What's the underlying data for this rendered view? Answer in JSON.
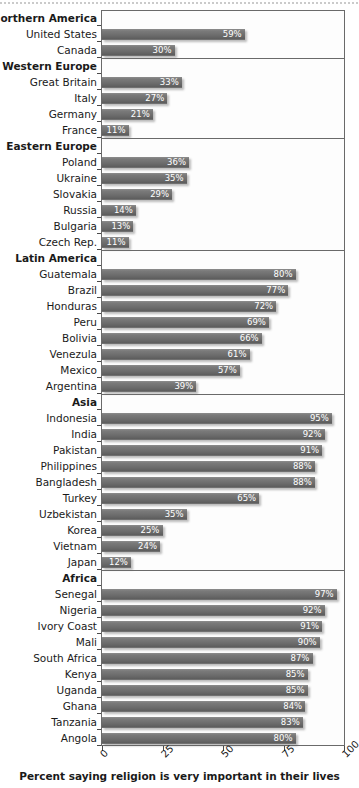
{
  "chart_data": {
    "type": "bar",
    "title": "",
    "subtitle": "",
    "xlabel": "Percent saying religion is very important in their lives",
    "ylabel": "",
    "xlim": [
      0,
      100
    ],
    "xticks": [
      0,
      25,
      50,
      75,
      100
    ],
    "xtick_labels": [
      "0",
      "25",
      "50",
      "75",
      "100"
    ],
    "grid": false,
    "legend": "none",
    "orientation": "horizontal",
    "value_suffix": "%",
    "bar_color": "#6d6d6d",
    "value_label_color": "#ffffff",
    "frame_color": "#6a6a6a",
    "groups": [
      {
        "name": "Northern  America",
        "items": [
          {
            "label": "United States",
            "value": 59,
            "value_label": "59%"
          },
          {
            "label": "Canada",
            "value": 30,
            "value_label": "30%"
          }
        ]
      },
      {
        "name": "Western Europe",
        "items": [
          {
            "label": "Great Britain",
            "value": 33,
            "value_label": "33%"
          },
          {
            "label": "Italy",
            "value": 27,
            "value_label": "27%"
          },
          {
            "label": "Germany",
            "value": 21,
            "value_label": "21%"
          },
          {
            "label": "France",
            "value": 11,
            "value_label": "11%"
          }
        ]
      },
      {
        "name": "Eastern Europe",
        "items": [
          {
            "label": "Poland",
            "value": 36,
            "value_label": "36%"
          },
          {
            "label": "Ukraine",
            "value": 35,
            "value_label": "35%"
          },
          {
            "label": "Slovakia",
            "value": 29,
            "value_label": "29%"
          },
          {
            "label": "Russia",
            "value": 14,
            "value_label": "14%"
          },
          {
            "label": "Bulgaria",
            "value": 13,
            "value_label": "13%"
          },
          {
            "label": "Czech Rep.",
            "value": 11,
            "value_label": "11%"
          }
        ]
      },
      {
        "name": "Latin America",
        "items": [
          {
            "label": "Guatemala",
            "value": 80,
            "value_label": "80%"
          },
          {
            "label": "Brazil",
            "value": 77,
            "value_label": "77%"
          },
          {
            "label": "Honduras",
            "value": 72,
            "value_label": "72%"
          },
          {
            "label": "Peru",
            "value": 69,
            "value_label": "69%"
          },
          {
            "label": "Bolivia",
            "value": 66,
            "value_label": "66%"
          },
          {
            "label": "Venezula",
            "value": 61,
            "value_label": "61%"
          },
          {
            "label": "Mexico",
            "value": 57,
            "value_label": "57%"
          },
          {
            "label": "Argentina",
            "value": 39,
            "value_label": "39%"
          }
        ]
      },
      {
        "name": "Asia",
        "items": [
          {
            "label": "Indonesia",
            "value": 95,
            "value_label": "95%"
          },
          {
            "label": "India",
            "value": 92,
            "value_label": "92%"
          },
          {
            "label": "Pakistan",
            "value": 91,
            "value_label": "91%"
          },
          {
            "label": "Philippines",
            "value": 88,
            "value_label": "88%"
          },
          {
            "label": "Bangladesh",
            "value": 88,
            "value_label": "88%"
          },
          {
            "label": "Turkey",
            "value": 65,
            "value_label": "65%"
          },
          {
            "label": "Uzbekistan",
            "value": 35,
            "value_label": "35%"
          },
          {
            "label": "Korea",
            "value": 25,
            "value_label": "25%"
          },
          {
            "label": "Vietnam",
            "value": 24,
            "value_label": "24%"
          },
          {
            "label": "Japan",
            "value": 12,
            "value_label": "12%"
          }
        ]
      },
      {
        "name": "Africa",
        "items": [
          {
            "label": "Senegal",
            "value": 97,
            "value_label": "97%"
          },
          {
            "label": "Nigeria",
            "value": 92,
            "value_label": "92%"
          },
          {
            "label": "Ivory Coast",
            "value": 91,
            "value_label": "91%"
          },
          {
            "label": "Mali",
            "value": 90,
            "value_label": "90%"
          },
          {
            "label": "South Africa",
            "value": 87,
            "value_label": "87%"
          },
          {
            "label": "Kenya",
            "value": 85,
            "value_label": "85%"
          },
          {
            "label": "Uganda",
            "value": 85,
            "value_label": "85%"
          },
          {
            "label": "Ghana",
            "value": 84,
            "value_label": "84%"
          },
          {
            "label": "Tanzania",
            "value": 83,
            "value_label": "83%"
          },
          {
            "label": "Angola",
            "value": 80,
            "value_label": "80%"
          }
        ]
      }
    ]
  }
}
